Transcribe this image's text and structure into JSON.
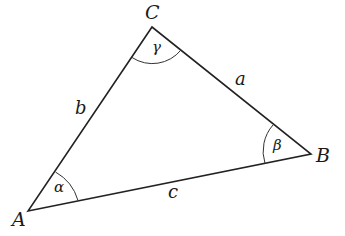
{
  "diagram": {
    "type": "triangle",
    "vertices": [
      {
        "name": "A",
        "x": 28,
        "y": 211
      },
      {
        "name": "B",
        "x": 311,
        "y": 154
      },
      {
        "name": "C",
        "x": 152,
        "y": 27
      }
    ],
    "sides": [
      {
        "name": "a",
        "between": [
          "B",
          "C"
        ]
      },
      {
        "name": "b",
        "between": [
          "A",
          "C"
        ]
      },
      {
        "name": "c",
        "between": [
          "A",
          "B"
        ]
      }
    ],
    "angles": [
      {
        "name": "α",
        "at": "A"
      },
      {
        "name": "β",
        "at": "B"
      },
      {
        "name": "γ",
        "at": "C"
      }
    ],
    "stroke_color": "#222222"
  },
  "labels": {
    "A": "A",
    "B": "B",
    "C": "C",
    "a": "a",
    "b": "b",
    "c": "c",
    "alpha": "α",
    "beta": "β",
    "gamma": "γ"
  }
}
